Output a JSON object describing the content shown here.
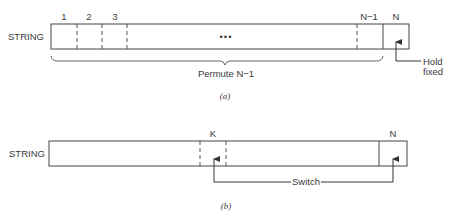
{
  "figure_a": {
    "row_label": "STRING",
    "cell_labels": [
      "1",
      "2",
      "3",
      "N−1",
      "N"
    ],
    "ellipsis": "•••",
    "brace_label": "Permute N−1",
    "hold_label_line1": "Hold",
    "hold_label_line2": "fixed",
    "caption": "(a)"
  },
  "figure_b": {
    "row_label": "STRING",
    "cell_labels": [
      "K",
      "N"
    ],
    "switch_label": "Switch",
    "caption": "(b)"
  }
}
